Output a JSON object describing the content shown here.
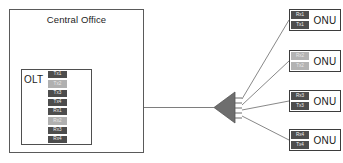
{
  "diagram": {
    "central_office": {
      "label": "Central Office",
      "olt": {
        "label": "OLT",
        "ports": [
          {
            "label": "Tx1",
            "shade": "dark"
          },
          {
            "label": "Tx2",
            "shade": "light"
          },
          {
            "label": "Tx3",
            "shade": "dark"
          },
          {
            "label": "Tx4",
            "shade": "dark"
          },
          {
            "label": "Rx1",
            "shade": "dark"
          },
          {
            "label": "Rx2",
            "shade": "light"
          },
          {
            "label": "Rx3",
            "shade": "dark"
          },
          {
            "label": "Rx4",
            "shade": "dark"
          }
        ]
      },
      "coupler": {
        "name": "wdm-coupler"
      }
    },
    "splitter": {
      "name": "optical-splitter",
      "outputs": 4
    },
    "onus": [
      {
        "name": "ONU",
        "rx": "Rx1",
        "tx": "Tx1",
        "shade": "dark"
      },
      {
        "name": "ONU",
        "rx": "Rx2",
        "tx": "Tx2",
        "shade": "light"
      },
      {
        "name": "ONU",
        "rx": "Rx3",
        "tx": "Tx3",
        "shade": "dark"
      },
      {
        "name": "ONU",
        "rx": "Rx4",
        "tx": "Tx4",
        "shade": "dark"
      }
    ],
    "colors": {
      "outline": "#5a5a5a",
      "port_dark": "#4d4d4d",
      "port_light": "#b0b0b0",
      "splitter_fill": "#6e6e6e",
      "fiber": "#7a7a7a"
    }
  }
}
